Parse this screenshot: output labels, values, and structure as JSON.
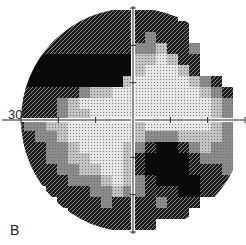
{
  "figure": {
    "type": "visual-field-grayscale-plot",
    "axis_label": "30°",
    "panel_label": "B"
  },
  "grid": {
    "cols": 20,
    "rows": 20,
    "cell": 11,
    "origin_x": 13,
    "origin_y": 10,
    "center_x": 133,
    "center_y": 120,
    "radius": 112
  },
  "levels": {
    "0": "#ffffff",
    "1": "#e8e8e8",
    "2": "#c4c4c4",
    "3": "#8c8c8c",
    "4": "#4a4a4a",
    "5": "#0a0a0a"
  },
  "map": [
    "....44444444444.....",
    "...4444444444444....",
    "..44444444443444....",
    ".4444444444332443...",
    ".5555555555221244...",
    "55555555555211124...",
    "5555555555211111234.",
    "44444432211111111234",
    "44443211111111111123",
    "44443221111111111123",
    "43322111111211111123",
    "44332111111233322223",
    "44433211112345543233",
    ".4433221112455554333",
    ".4443322112455554443",
    "..444333212345555444",
    "...44443323344455444",
    "....4444344443444...",
    ".....44444444444....",
    "......4444444......."
  ]
}
